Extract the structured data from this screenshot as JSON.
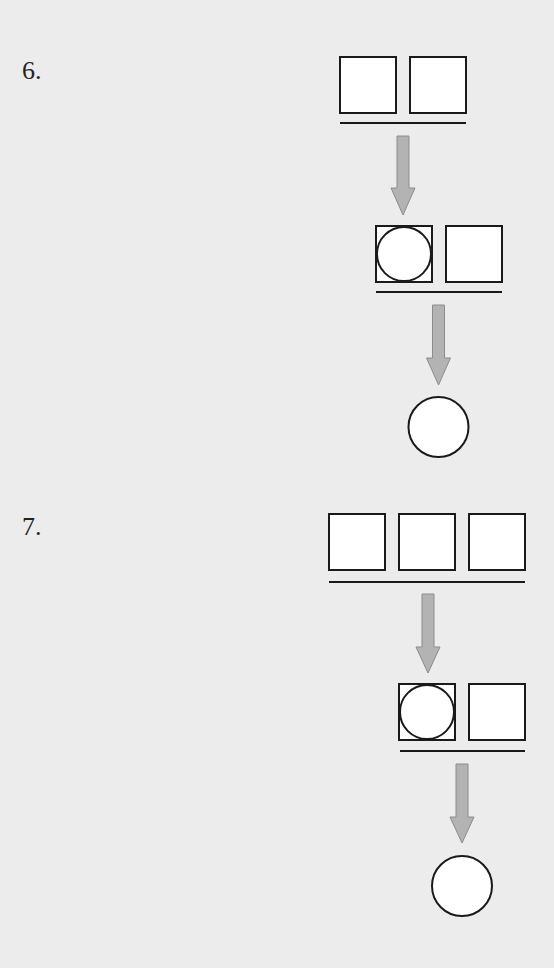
{
  "problems": [
    {
      "number": "6.",
      "label_pos": [
        22,
        58
      ],
      "rows": [
        {
          "boxes": [
            {
              "x": 340,
              "y": 57,
              "size": 56,
              "has_circle": false
            },
            {
              "x": 410,
              "y": 57,
              "size": 56,
              "has_circle": false
            }
          ],
          "underline": {
            "x1": 340,
            "x2": 466,
            "y": 123
          }
        },
        {
          "boxes": [
            {
              "x": 376,
              "y": 226,
              "size": 56,
              "has_circle": true
            },
            {
              "x": 446,
              "y": 226,
              "size": 56,
              "has_circle": false
            }
          ],
          "underline": {
            "x1": 376,
            "x2": 502,
            "y": 292
          }
        }
      ],
      "arrows": [
        {
          "cx": 403,
          "shaft_top": 136,
          "head_top": 188,
          "tip": 215,
          "shaft_w": 12,
          "head_w": 24
        },
        {
          "cx": 438.5,
          "shaft_top": 305,
          "head_top": 358,
          "tip": 385,
          "shaft_w": 12,
          "head_w": 24
        }
      ],
      "result_circle": {
        "cx": 438.5,
        "cy": 427,
        "r": 30
      }
    },
    {
      "number": "7.",
      "label_pos": [
        22,
        514
      ],
      "rows": [
        {
          "boxes": [
            {
              "x": 329,
              "y": 514,
              "size": 56,
              "has_circle": false
            },
            {
              "x": 399,
              "y": 514,
              "size": 56,
              "has_circle": false
            },
            {
              "x": 469,
              "y": 514,
              "size": 56,
              "has_circle": false
            }
          ],
          "underline": {
            "x1": 329,
            "x2": 525,
            "y": 582
          }
        },
        {
          "boxes": [
            {
              "x": 399,
              "y": 684,
              "size": 56,
              "has_circle": true
            },
            {
              "x": 469,
              "y": 684,
              "size": 56,
              "has_circle": false
            }
          ],
          "underline": {
            "x1": 400,
            "x2": 525,
            "y": 751
          }
        }
      ],
      "arrows": [
        {
          "cx": 428,
          "shaft_top": 594,
          "head_top": 647,
          "tip": 673,
          "shaft_w": 12,
          "head_w": 24
        },
        {
          "cx": 462,
          "shaft_top": 764,
          "head_top": 817,
          "tip": 843,
          "shaft_w": 12,
          "head_w": 24
        }
      ],
      "result_circle": {
        "cx": 462,
        "cy": 886,
        "r": 30
      }
    }
  ],
  "colors": {
    "background": "#ececec",
    "stroke": "#1a1a1a",
    "shape_fill": "#ffffff",
    "arrow_fill": "#b3b3b3",
    "arrow_stroke": "#8c8c8c",
    "text": "#222222"
  }
}
